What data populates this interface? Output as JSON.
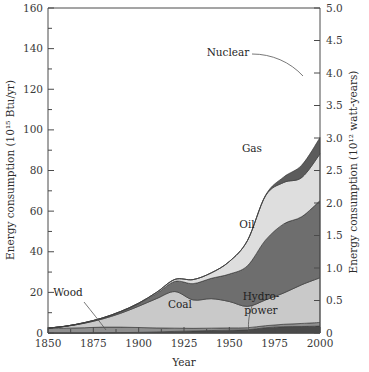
{
  "chart_data": {
    "type": "area",
    "title": "",
    "xlabel": "Year",
    "ylabel": "Energy consumption (10¹⁵ Btu/yr)",
    "ylabel_right": "Energy consumption (10¹² watt-years)",
    "xlim": [
      1850,
      2000
    ],
    "ylim": [
      0,
      160
    ],
    "ylim_right": [
      0,
      5.0
    ],
    "grid": false,
    "legend_position": "inline-annotations",
    "xticks": [
      1850,
      1875,
      1900,
      1925,
      1950,
      1975,
      2000
    ],
    "xtick_labels": [
      "1850",
      "1875",
      "1900",
      "1925",
      "1950",
      "1975",
      "2000"
    ],
    "xminor_ticks": [
      1862.5,
      1887.5,
      1912.5,
      1937.5,
      1962.5,
      1987.5
    ],
    "yticks": [
      0,
      20,
      40,
      60,
      80,
      100,
      120,
      140,
      160
    ],
    "ytick_labels": [
      "0",
      "20",
      "40",
      "60",
      "80",
      "100",
      "120",
      "140",
      "160"
    ],
    "yminor_ticks": [
      10,
      30,
      50,
      70,
      90,
      110,
      130,
      150
    ],
    "yticks_right": [
      0,
      0.5,
      1.0,
      1.5,
      2.0,
      2.5,
      3.0,
      3.5,
      4.0,
      4.5,
      5.0
    ],
    "ytick_labels_right": [
      "0",
      "0.5",
      "1.0",
      "1.5",
      "2.0",
      "2.5",
      "3.0",
      "3.5",
      "4.0",
      "4.5",
      "5.0"
    ],
    "x": [
      1850,
      1860,
      1870,
      1880,
      1890,
      1900,
      1910,
      1920,
      1930,
      1940,
      1950,
      1960,
      1970,
      1980,
      1990,
      2000
    ],
    "stack_order_bottom_to_top": [
      "Hydro-power",
      "Wood",
      "Coal",
      "Oil",
      "Gas",
      "Nuclear"
    ],
    "series": [
      {
        "name": "Hydro-power",
        "label": "Hydro-\npower",
        "color": "#4a4a4a",
        "values": [
          0.0,
          0.0,
          0.0,
          0.1,
          0.2,
          0.3,
          0.5,
          0.8,
          1.0,
          1.2,
          1.4,
          1.6,
          2.6,
          3.1,
          3.2,
          3.4
        ]
      },
      {
        "name": "Wood",
        "label": "Wood",
        "color": "#8f8f8f",
        "values": [
          2.2,
          2.4,
          2.6,
          2.8,
          2.7,
          2.4,
          2.0,
          1.6,
          1.3,
          1.2,
          1.1,
          1.0,
          1.0,
          1.2,
          1.5,
          1.8
        ]
      },
      {
        "name": "Coal",
        "label": "Coal",
        "color": "#c9c9c9",
        "values": [
          0.2,
          0.9,
          2.2,
          4.0,
          6.8,
          10.5,
          14.5,
          18.0,
          14.0,
          14.5,
          13.0,
          10.5,
          12.7,
          15.4,
          19.1,
          22.0
        ]
      },
      {
        "name": "Oil",
        "label": "Oil",
        "color": "#6e6e6e",
        "values": [
          0.0,
          0.1,
          0.2,
          0.4,
          0.7,
          1.2,
          2.5,
          5.0,
          8.0,
          10.0,
          13.5,
          20.0,
          29.5,
          34.0,
          33.5,
          38.0
        ]
      },
      {
        "name": "Gas",
        "label": "Gas",
        "color": "#dedede",
        "values": [
          0.0,
          0.0,
          0.1,
          0.1,
          0.2,
          0.3,
          0.6,
          1.0,
          2.0,
          2.7,
          6.2,
          12.4,
          21.8,
          20.4,
          19.3,
          23.0
        ]
      },
      {
        "name": "Nuclear",
        "label": "Nuclear",
        "color": "#5c5c5c",
        "values": [
          0.0,
          0.0,
          0.0,
          0.0,
          0.0,
          0.0,
          0.0,
          0.0,
          0.0,
          0.0,
          0.0,
          0.1,
          0.3,
          2.7,
          6.1,
          8.0
        ]
      }
    ],
    "totals": [
      2.4,
      3.4,
      5.1,
      7.4,
      10.6,
      14.7,
      20.1,
      26.4,
      26.3,
      29.6,
      35.2,
      45.6,
      67.9,
      76.8,
      82.7,
      96.2
    ],
    "annotations": [
      {
        "text": "Nuclear",
        "x_px": 228,
        "y_px": 56
      },
      {
        "text": "Gas",
        "x_px": 252,
        "y_px": 152
      },
      {
        "text": "Oil",
        "x_px": 247,
        "y_px": 228
      },
      {
        "text": "Coal",
        "x_px": 180,
        "y_px": 308
      },
      {
        "text": "Wood",
        "x_px": 68,
        "y_px": 296
      },
      {
        "text": "Hydro-",
        "x_px": 261,
        "y_px": 300
      },
      {
        "text": "power",
        "x_px": 261,
        "y_px": 314
      }
    ]
  },
  "plot": {
    "left_px": 48,
    "right_px": 320,
    "top_px": 8,
    "bottom_px": 333
  }
}
